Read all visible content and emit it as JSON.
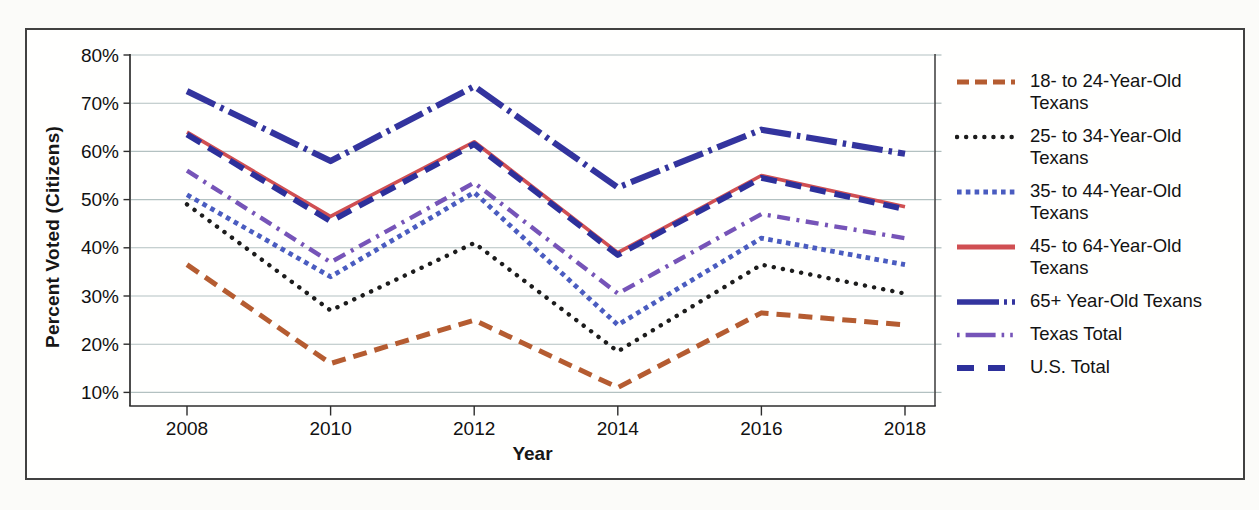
{
  "chart_data": {
    "type": "line",
    "title": "",
    "xlabel": "Year",
    "ylabel": "Percent Voted (Citizens)",
    "x": [
      2008,
      2010,
      2012,
      2014,
      2016,
      2018
    ],
    "x_tick_labels": [
      "2008",
      "2010",
      "2012",
      "2014",
      "2016",
      "2018"
    ],
    "y_tick_labels": [
      "80%",
      "70%",
      "60%",
      "50%",
      "40%",
      "30%",
      "20%",
      "10%"
    ],
    "y_ticks": [
      80,
      70,
      60,
      50,
      40,
      30,
      20,
      10
    ],
    "ylim": [
      7,
      80
    ],
    "grid": true,
    "legend_position": "right",
    "series": [
      {
        "name": "18- to 24-Year-Old Texans",
        "legend_lines": [
          "18- to 24-Year-Old",
          "Texans"
        ],
        "color": "#b55c31",
        "style": "dashed",
        "values": [
          36.5,
          16,
          25,
          11,
          26.5,
          24
        ]
      },
      {
        "name": "25- to 34-Year-Old Texans",
        "legend_lines": [
          "25- to 34-Year-Old",
          "Texans"
        ],
        "color": "#1c1c1c",
        "style": "dotted-round",
        "values": [
          49,
          27,
          41,
          18.5,
          36.5,
          30.5
        ]
      },
      {
        "name": "35- to 44-Year-Old Texans",
        "legend_lines": [
          "35- to 44-Year-Old",
          "Texans"
        ],
        "color": "#4a5cc0",
        "style": "dotted-square",
        "values": [
          51,
          34,
          51.5,
          24,
          42,
          36.5
        ]
      },
      {
        "name": "45- to 64-Year-Old Texans",
        "legend_lines": [
          "45- to 64-Year-Old",
          "Texans"
        ],
        "color": "#d04f52",
        "style": "solid",
        "values": [
          64,
          46.5,
          62,
          39,
          55,
          48.5
        ]
      },
      {
        "name": "65+ Year-Old Texans",
        "legend_lines": [
          "65+ Year-Old Texans"
        ],
        "color": "#33349e",
        "style": "longdash-dot",
        "values": [
          72.5,
          58,
          73.5,
          52.5,
          64.5,
          59.5
        ]
      },
      {
        "name": "Texas Total",
        "legend_lines": [
          "Texas Total"
        ],
        "color": "#7654b8",
        "style": "dash-dot",
        "values": [
          56,
          37,
          53.5,
          30.5,
          47,
          42
        ]
      },
      {
        "name": "U.S. Total",
        "legend_lines": [
          "U.S. Total"
        ],
        "color": "#2d309b",
        "style": "dash",
        "values": [
          63.5,
          45.5,
          61.5,
          38.5,
          54.5,
          48
        ]
      }
    ],
    "colors": {
      "gridline": "#b3c1c1",
      "axis": "#2d2d2d",
      "tick_label": "#111111",
      "right_stub": "#aebcbc"
    }
  }
}
